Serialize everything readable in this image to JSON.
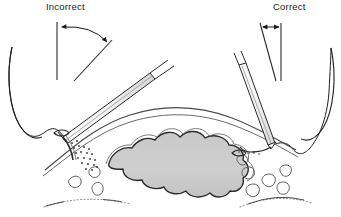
{
  "figure": {
    "kind": "surgical-technique-illustration",
    "title_incorrect": "Incorrect",
    "title_correct": "Correct",
    "background_color": "#ffffff",
    "ink_color": "#1a1a1a",
    "line_color": "#3a3a3a"
  },
  "labels": [
    {
      "id": "incorrect",
      "text": "Incorrect",
      "x": 46,
      "y": 9
    },
    {
      "id": "correct",
      "text": "Correct",
      "x": 273,
      "y": 9
    }
  ],
  "angle_indicators": [
    {
      "id": "wide-angle",
      "side": "left",
      "meaning": "wide needle-entry angle",
      "arrow_style": "curved-double-headed",
      "vertical_line": {
        "x1": 57,
        "y1": 22,
        "x2": 57,
        "y2": 79
      },
      "diagonal_line": {
        "x1": 74,
        "y1": 79,
        "x2": 111,
        "y2": 41
      },
      "arc": "M 61 27 Q 92 26 107 43"
    },
    {
      "id": "narrow-angle",
      "side": "right",
      "meaning": "narrow needle-entry angle",
      "arrow_style": "straight-double-headed",
      "vertical_line": {
        "x1": 280,
        "y1": 24,
        "x2": 280,
        "y2": 80
      },
      "diagonal_line": {
        "x1": 259,
        "y1": 24,
        "x2": 275,
        "y2": 80
      },
      "arrow": {
        "x1": 262,
        "y1": 27,
        "x2": 278,
        "y2": 27
      }
    }
  ],
  "instruments": [
    {
      "id": "needle-holder-left",
      "side": "left",
      "orientation": "shallow-oblique",
      "tip_x": 63,
      "tip_y": 136
    },
    {
      "id": "needle-holder-right",
      "side": "right",
      "orientation": "steep-near-vertical",
      "tip_x": 271,
      "tip_y": 145
    }
  ],
  "anatomy": {
    "mass": {
      "id": "central-mass",
      "fill": "#cccccc",
      "stroke": "#2a2a2a",
      "description": "lobulated grey mass beneath fascia"
    },
    "fascia_line": {
      "stroke": "#3a3a3a",
      "description": "arched fascial plane over the mass"
    },
    "skin_edges": {
      "stroke": "#2a2a2a",
      "description": "wavy skin/tissue edges at left and right"
    },
    "fat_lobules": {
      "stroke": "#5a5a5a",
      "description": "small irregular oval fat lobules flanking the mass"
    },
    "stipple": {
      "color": "#3a3a3a",
      "description": "stippled dots marking tissue trauma at needle entry"
    },
    "bottom_contours": {
      "stroke": "#8a8a8a",
      "description": "faint dashed curved contour lines at lower margin"
    }
  },
  "sutures": [
    {
      "id": "suture-thread-left",
      "side": "left",
      "description": "thread looping from left skin edge to needle tip"
    },
    {
      "id": "suture-thread-right",
      "side": "right",
      "description": "thread looping from needle tip to right skin edge"
    }
  ]
}
